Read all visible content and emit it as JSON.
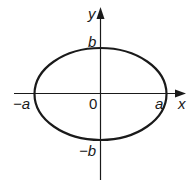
{
  "diagram": {
    "type": "ellipse-on-axes",
    "colors": {
      "background": "#ffffff",
      "stroke": "#1a1a1a"
    },
    "axes": {
      "x_label": "x",
      "y_label": "y",
      "origin_label": "0"
    },
    "ellipse": {
      "center_label": "0",
      "semi_major_label": "a",
      "semi_minor_label": "b"
    },
    "labels": {
      "pos_a": "a",
      "neg_a": "−a",
      "pos_b": "b",
      "neg_b": "−b"
    }
  }
}
